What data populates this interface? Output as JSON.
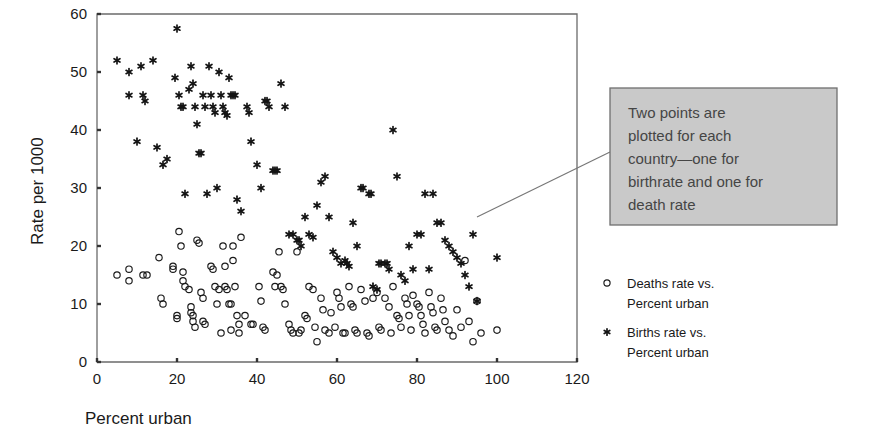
{
  "chart_data": {
    "type": "scatter",
    "title": "",
    "xlabel": "Percent urban",
    "ylabel": "Rate per 1000",
    "xlim": [
      0,
      120
    ],
    "ylim": [
      0,
      60
    ],
    "xticks": [
      0,
      20,
      40,
      60,
      80,
      100,
      120
    ],
    "yticks": [
      0,
      10,
      20,
      30,
      40,
      50,
      60
    ],
    "grid": false,
    "legend_position": "right",
    "series": [
      {
        "name": "Deaths rate vs. Percent urban",
        "marker": "open-circle",
        "color": "#1a1a1a",
        "points": [
          [
            5,
            15
          ],
          [
            8,
            16
          ],
          [
            8,
            14
          ],
          [
            11.5,
            15
          ],
          [
            12.5,
            15
          ],
          [
            15.5,
            18
          ],
          [
            16,
            11
          ],
          [
            16.5,
            10
          ],
          [
            19,
            16.5
          ],
          [
            19,
            16
          ],
          [
            20,
            8
          ],
          [
            20,
            7.5
          ],
          [
            20.5,
            22.5
          ],
          [
            21,
            20
          ],
          [
            21.5,
            15.5
          ],
          [
            21.5,
            14
          ],
          [
            22,
            13
          ],
          [
            23,
            12.5
          ],
          [
            23.5,
            9.5
          ],
          [
            23.5,
            8.5
          ],
          [
            24,
            8
          ],
          [
            24,
            7
          ],
          [
            24.5,
            6
          ],
          [
            25,
            21
          ],
          [
            25.5,
            20.5
          ],
          [
            26,
            12
          ],
          [
            26.5,
            11
          ],
          [
            26.5,
            7
          ],
          [
            27,
            6.5
          ],
          [
            28.5,
            16.5
          ],
          [
            29,
            16
          ],
          [
            29.5,
            13
          ],
          [
            30,
            10
          ],
          [
            30.5,
            12.5
          ],
          [
            31,
            5
          ],
          [
            31.5,
            20
          ],
          [
            32,
            16.5
          ],
          [
            32,
            13
          ],
          [
            32.5,
            12.5
          ],
          [
            33,
            10
          ],
          [
            33.5,
            10
          ],
          [
            33.5,
            5.5
          ],
          [
            34,
            17.5
          ],
          [
            34,
            20
          ],
          [
            34.5,
            13
          ],
          [
            35,
            8
          ],
          [
            35.5,
            6.5
          ],
          [
            35.5,
            5
          ],
          [
            36,
            21.5
          ],
          [
            37,
            8
          ],
          [
            38.5,
            6.5
          ],
          [
            39,
            6.5
          ],
          [
            40.5,
            13
          ],
          [
            41,
            10.5
          ],
          [
            41.5,
            6
          ],
          [
            42,
            5.5
          ],
          [
            44,
            15.5
          ],
          [
            44.5,
            13
          ],
          [
            45,
            15
          ],
          [
            45.5,
            19
          ],
          [
            46,
            13
          ],
          [
            46.5,
            12.5
          ],
          [
            47,
            10
          ],
          [
            48,
            6.5
          ],
          [
            48.5,
            5.5
          ],
          [
            49,
            5
          ],
          [
            50,
            19
          ],
          [
            50.5,
            5
          ],
          [
            51,
            5.5
          ],
          [
            52,
            8
          ],
          [
            52.5,
            7.5
          ],
          [
            53,
            13
          ],
          [
            54,
            12.5
          ],
          [
            54.5,
            6
          ],
          [
            55,
            3.5
          ],
          [
            56,
            11
          ],
          [
            56.5,
            9
          ],
          [
            57,
            5.5
          ],
          [
            58,
            5
          ],
          [
            58.5,
            8.5
          ],
          [
            59.5,
            6
          ],
          [
            60,
            12
          ],
          [
            60.5,
            11
          ],
          [
            61,
            9.5
          ],
          [
            61.5,
            5
          ],
          [
            62,
            5
          ],
          [
            63,
            13
          ],
          [
            63.5,
            10
          ],
          [
            64,
            9.5
          ],
          [
            64.5,
            5.5
          ],
          [
            65,
            5
          ],
          [
            66,
            12.5
          ],
          [
            67,
            10.5
          ],
          [
            67.5,
            5
          ],
          [
            68,
            4.5
          ],
          [
            69,
            11
          ],
          [
            70,
            12
          ],
          [
            70.5,
            6
          ],
          [
            71,
            5.5
          ],
          [
            72,
            11
          ],
          [
            73,
            9.5
          ],
          [
            73.5,
            5
          ],
          [
            74,
            13
          ],
          [
            75,
            8
          ],
          [
            75.5,
            7.5
          ],
          [
            76,
            6
          ],
          [
            77,
            11
          ],
          [
            77.5,
            10
          ],
          [
            78,
            8
          ],
          [
            78.5,
            5.5
          ],
          [
            79,
            11.5
          ],
          [
            80,
            10
          ],
          [
            80.5,
            9.5
          ],
          [
            81,
            8
          ],
          [
            81.5,
            6.5
          ],
          [
            82,
            5
          ],
          [
            83,
            12
          ],
          [
            83.5,
            9.5
          ],
          [
            84,
            8.5
          ],
          [
            84.5,
            6
          ],
          [
            85,
            5.5
          ],
          [
            86,
            11
          ],
          [
            86.5,
            9
          ],
          [
            87,
            7
          ],
          [
            88,
            5.5
          ],
          [
            89,
            4.5
          ],
          [
            90,
            9
          ],
          [
            91,
            6
          ],
          [
            92,
            17.5
          ],
          [
            93,
            7
          ],
          [
            94,
            3.5
          ],
          [
            95,
            10.5
          ],
          [
            96,
            5
          ],
          [
            100,
            5.5
          ]
        ]
      },
      {
        "name": "Births rate vs. Percent urban",
        "marker": "asterisk",
        "color": "#141414",
        "points": [
          [
            5,
            52
          ],
          [
            8,
            50
          ],
          [
            8,
            46
          ],
          [
            10,
            38
          ],
          [
            11,
            51
          ],
          [
            11.5,
            46
          ],
          [
            12,
            45
          ],
          [
            14,
            52
          ],
          [
            15,
            37
          ],
          [
            16.5,
            34
          ],
          [
            17.5,
            35
          ],
          [
            19.5,
            49
          ],
          [
            20,
            57.5
          ],
          [
            20.5,
            46
          ],
          [
            21,
            44
          ],
          [
            21.5,
            44
          ],
          [
            22,
            29
          ],
          [
            23,
            47
          ],
          [
            23.5,
            51
          ],
          [
            24,
            48
          ],
          [
            24.5,
            44
          ],
          [
            25,
            41
          ],
          [
            25.5,
            36
          ],
          [
            26,
            36
          ],
          [
            26.5,
            46
          ],
          [
            27,
            44
          ],
          [
            27.5,
            29
          ],
          [
            28,
            51
          ],
          [
            28.5,
            46
          ],
          [
            29,
            44
          ],
          [
            29.5,
            43
          ],
          [
            30,
            30
          ],
          [
            30.5,
            50
          ],
          [
            31,
            46
          ],
          [
            31.5,
            44
          ],
          [
            32,
            43
          ],
          [
            32.5,
            42.5
          ],
          [
            33,
            49
          ],
          [
            33.5,
            46
          ],
          [
            34,
            46
          ],
          [
            34.5,
            46
          ],
          [
            35,
            28
          ],
          [
            36,
            26
          ],
          [
            37.5,
            44
          ],
          [
            38,
            43
          ],
          [
            38.5,
            38
          ],
          [
            40,
            34
          ],
          [
            41,
            30
          ],
          [
            42,
            45
          ],
          [
            42.5,
            45
          ],
          [
            43,
            44
          ],
          [
            44,
            33
          ],
          [
            44.5,
            33
          ],
          [
            45,
            33
          ],
          [
            46,
            48
          ],
          [
            47,
            44
          ],
          [
            48,
            22
          ],
          [
            49,
            22
          ],
          [
            50,
            21
          ],
          [
            50.5,
            21
          ],
          [
            51,
            20
          ],
          [
            52,
            25
          ],
          [
            53,
            22
          ],
          [
            54,
            21.5
          ],
          [
            55,
            27
          ],
          [
            56,
            31
          ],
          [
            57,
            32
          ],
          [
            58,
            25
          ],
          [
            59,
            19
          ],
          [
            60,
            18
          ],
          [
            61,
            17
          ],
          [
            62,
            17.5
          ],
          [
            62.5,
            17
          ],
          [
            63,
            16.5
          ],
          [
            64,
            24
          ],
          [
            65,
            20
          ],
          [
            66,
            30
          ],
          [
            66.5,
            30
          ],
          [
            68,
            29
          ],
          [
            68.5,
            29
          ],
          [
            69,
            13
          ],
          [
            70,
            12.5
          ],
          [
            70.5,
            17
          ],
          [
            71,
            17
          ],
          [
            72,
            17
          ],
          [
            72.5,
            17
          ],
          [
            73,
            16
          ],
          [
            74,
            40
          ],
          [
            75,
            32
          ],
          [
            76,
            15
          ],
          [
            77,
            14
          ],
          [
            78,
            20
          ],
          [
            79,
            16
          ],
          [
            80,
            22
          ],
          [
            81,
            22
          ],
          [
            82,
            29
          ],
          [
            83,
            16
          ],
          [
            84,
            29
          ],
          [
            85,
            24
          ],
          [
            86,
            24
          ],
          [
            87,
            21
          ],
          [
            88,
            20
          ],
          [
            89,
            19
          ],
          [
            90,
            18
          ],
          [
            91,
            17
          ],
          [
            92,
            15
          ],
          [
            93,
            13
          ],
          [
            94,
            22
          ],
          [
            95,
            10.5
          ],
          [
            100,
            18
          ]
        ]
      }
    ],
    "annotation": {
      "lines": [
        "Two points are",
        "plotted for each",
        "country—one for",
        "birthrate and one for",
        "death rate"
      ],
      "box_fill": "#c9c9c9",
      "box_border": "#6f6f6f",
      "leader_from": [
        95,
        25
      ],
      "leader_to": [
        610,
        152
      ]
    },
    "legend": [
      {
        "marker": "open-circle",
        "line1": "Deaths rate vs.",
        "line2": "Percent urban"
      },
      {
        "marker": "asterisk",
        "line1": "Births rate vs.",
        "line2": "Percent urban"
      }
    ]
  }
}
